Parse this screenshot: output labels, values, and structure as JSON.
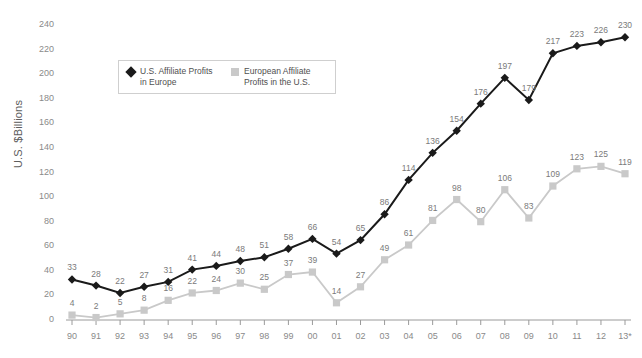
{
  "chart_data": {
    "type": "line",
    "title": "",
    "xlabel": "",
    "ylabel": "U.S. $Billions",
    "ylim": [
      0,
      240
    ],
    "ytick_step": 20,
    "yticks": [
      0,
      20,
      40,
      60,
      80,
      100,
      120,
      140,
      160,
      180,
      200,
      220,
      240
    ],
    "grid": false,
    "legend_position": "top-center",
    "categories": [
      "90",
      "91",
      "92",
      "93",
      "94",
      "95",
      "96",
      "97",
      "98",
      "99",
      "00",
      "01",
      "02",
      "03",
      "04",
      "05",
      "06",
      "07",
      "08",
      "09",
      "10",
      "11",
      "12",
      "13*"
    ],
    "series": [
      {
        "name": "U.S. Affiliate Profits in Europe",
        "color": "#1a1a1a",
        "marker": "diamond",
        "values": [
          33,
          28,
          22,
          27,
          31,
          41,
          44,
          48,
          51,
          58,
          66,
          54,
          65,
          86,
          114,
          136,
          154,
          176,
          197,
          179,
          217,
          223,
          226,
          230
        ]
      },
      {
        "name": "European Affiliate Profits in the U.S.",
        "color": "#c9c9c9",
        "marker": "square",
        "values": [
          4,
          2,
          5,
          8,
          16,
          22,
          24,
          30,
          25,
          37,
          39,
          14,
          27,
          49,
          61,
          81,
          98,
          80,
          106,
          83,
          109,
          123,
          125,
          119
        ]
      }
    ]
  },
  "legend": {
    "entries": [
      {
        "label": "U.S. Affiliate Profits\nin Europe",
        "marker": "diamond-marker",
        "color": "#1a1a1a"
      },
      {
        "label": "European Affiliate\nProfits in the U.S.",
        "marker": "square-marker",
        "color": "#c9c9c9"
      }
    ]
  },
  "colors": {
    "background": "#ffffff",
    "axis": "#9a9a9a",
    "label_text": "#7a7a7a",
    "series_dark": "#1a1a1a",
    "series_light": "#c9c9c9"
  }
}
